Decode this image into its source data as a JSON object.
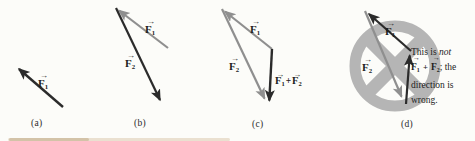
{
  "colors": {
    "vector_dark": "#2b2b2b",
    "vector_gray": "#8f8f8f",
    "prohibition_gray": "#b5b5b5",
    "text": "#1d1d1d"
  },
  "glyphs": {
    "vector_arrow": "→"
  },
  "panels": {
    "a": {
      "letter": "(a)",
      "f1": {
        "base": "F",
        "sub": "1"
      }
    },
    "b": {
      "letter": "(b)",
      "f1": {
        "base": "F",
        "sub": "1"
      },
      "f2": {
        "base": "F",
        "sub": "2"
      }
    },
    "c": {
      "letter": "(c)",
      "f1": {
        "base": "F",
        "sub": "1"
      },
      "f2": {
        "base": "F",
        "sub": "2"
      },
      "sum": {
        "f1": {
          "base": "F",
          "sub": "1"
        },
        "plus": "+",
        "f2": {
          "base": "F",
          "sub": "2"
        }
      }
    },
    "d": {
      "letter": "(d)",
      "f1": {
        "base": "F",
        "sub": "1"
      },
      "f2": {
        "base": "F",
        "sub": "2"
      },
      "note": {
        "l1_prefix": "This is ",
        "l1_italic": "not",
        "l2_f1": {
          "base": "F",
          "sub": "1"
        },
        "l2_plus": " + ",
        "l2_f2": {
          "base": "F",
          "sub": "2"
        },
        "l2_tail": "; the",
        "l3": "direction is",
        "l4": "wrong."
      }
    }
  }
}
